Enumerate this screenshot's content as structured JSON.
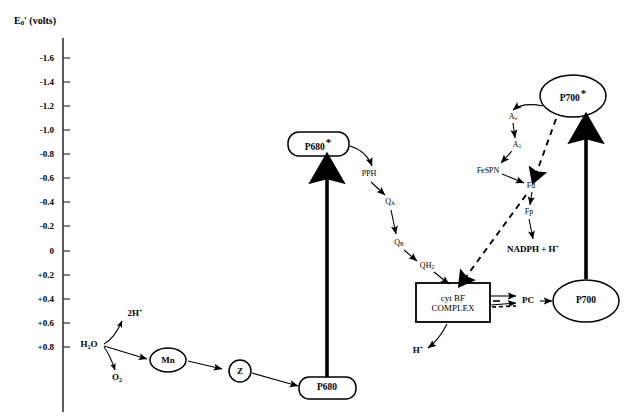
{
  "figure": {
    "type": "diagram"
  },
  "axis": {
    "title_main": "E",
    "title_sub": "0",
    "title_prime": "' (volts)",
    "title_full": "E0' (volts)",
    "ticks": [
      {
        "label": "-1.6",
        "value": -1.6,
        "y": 58
      },
      {
        "label": "-1.4",
        "value": -1.4,
        "y": 82
      },
      {
        "label": "-1.2",
        "value": -1.2,
        "y": 106
      },
      {
        "label": "-1.0",
        "value": -1.0,
        "y": 130
      },
      {
        "label": "-0.8",
        "value": -0.8,
        "y": 154
      },
      {
        "label": "-0.6",
        "value": -0.6,
        "y": 178
      },
      {
        "label": "-0.4",
        "value": -0.4,
        "y": 202
      },
      {
        "label": "-0.2",
        "value": -0.2,
        "y": 226
      },
      {
        "label": "0",
        "value": 0,
        "y": 251
      },
      {
        "label": "+0.2",
        "value": 0.2,
        "y": 275
      },
      {
        "label": "+0.4",
        "value": 0.4,
        "y": 299
      },
      {
        "label": "+0.6",
        "value": 0.6,
        "y": 323
      },
      {
        "label": "+0.8",
        "value": 0.8,
        "y": 347
      }
    ],
    "line_color": "#333333"
  },
  "nodes": {
    "p680_excited": {
      "label": "P680",
      "star": "*",
      "shape": "rounded-rect",
      "x": 318,
      "y": 145
    },
    "p680": {
      "label": "P680",
      "star": "",
      "shape": "rounded-rect",
      "x": 327,
      "y": 388
    },
    "p700_excited": {
      "label": "P700",
      "star": "*",
      "shape": "ellipse",
      "x": 573,
      "y": 96
    },
    "p700": {
      "label": "P700",
      "star": "",
      "shape": "ellipse",
      "x": 586,
      "y": 301
    },
    "mn": {
      "label": "Mn",
      "shape": "ellipse",
      "x": 168,
      "y": 360
    },
    "z": {
      "label": "Z",
      "shape": "circle",
      "x": 240,
      "y": 371
    },
    "cyt_bf": {
      "label_line1": "cyt BF",
      "label_line2": "COMPLEX",
      "shape": "rect",
      "x": 453,
      "y": 303
    }
  },
  "carriers": [
    {
      "name": "PPH",
      "label": "PPH",
      "x": 369,
      "y": 174
    },
    {
      "name": "QA",
      "label": "Q",
      "sub": "A",
      "x": 390,
      "y": 202
    },
    {
      "name": "QB",
      "label": "Q",
      "sub": "B",
      "x": 399,
      "y": 243
    },
    {
      "name": "QH2",
      "label": "QH",
      "sub": "2",
      "x": 427,
      "y": 266
    },
    {
      "name": "Ao",
      "label": "A",
      "sub": "o",
      "x": 513,
      "y": 117
    },
    {
      "name": "A1",
      "label": "A",
      "sub": "1",
      "x": 517,
      "y": 145
    },
    {
      "name": "FeSPN",
      "label": "FeSPN",
      "x": 488,
      "y": 171
    },
    {
      "name": "Fd",
      "label": "Fd",
      "x": 531,
      "y": 186
    },
    {
      "name": "Fp",
      "label": "Fp",
      "x": 529,
      "y": 212
    },
    {
      "name": "PC",
      "label": "PC",
      "x": 528,
      "y": 300
    }
  ],
  "chemicals": [
    {
      "name": "water",
      "label": "H",
      "sub": "2",
      "label2": "O",
      "x": 89,
      "y": 345
    },
    {
      "name": "protons-2h",
      "label": "2H",
      "sup": "+",
      "x": 135,
      "y": 313
    },
    {
      "name": "oxygen",
      "label": "O",
      "sub": "2",
      "x": 117,
      "y": 378
    },
    {
      "name": "nadph",
      "label": "NADPH +  H",
      "sup": "+",
      "x": 533,
      "y": 249
    },
    {
      "name": "proton-h",
      "label": "H",
      "sup": "+",
      "x": 418,
      "y": 350
    }
  ],
  "colors": {
    "stroke": "#000000",
    "axis": "#333333",
    "background": "#ffffff"
  }
}
